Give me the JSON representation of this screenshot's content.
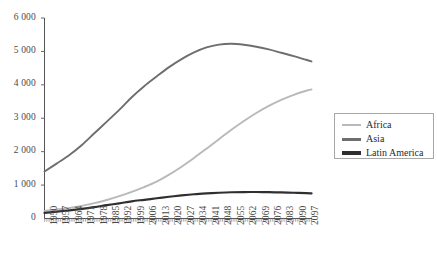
{
  "chart_data": {
    "type": "line",
    "title": "",
    "subtitle": "",
    "xlabel": "",
    "ylabel": "",
    "xlim": [
      1950,
      2100
    ],
    "ylim": [
      0,
      6000
    ],
    "grid": false,
    "legend_position": "right",
    "y_ticks": [
      {
        "value": 6000,
        "label": "6 000"
      },
      {
        "value": 5000,
        "label": "5 000"
      },
      {
        "value": 4000,
        "label": "4 000"
      },
      {
        "value": 3000,
        "label": "3 000"
      },
      {
        "value": 2000,
        "label": "2 000"
      },
      {
        "value": 1000,
        "label": "1 000"
      },
      {
        "value": 0,
        "label": "0"
      }
    ],
    "x_ticks": [
      "1950",
      "1957",
      "1964",
      "1971",
      "1978",
      "1985",
      "1992",
      "1999",
      "2006",
      "2013",
      "2020",
      "2027",
      "2034",
      "2041",
      "2048",
      "2055",
      "2062",
      "2069",
      "2076",
      "2083",
      "2090",
      "2097"
    ],
    "x": [
      1950,
      1957,
      1964,
      1971,
      1978,
      1985,
      1992,
      1999,
      2006,
      2013,
      2020,
      2027,
      2034,
      2041,
      2048,
      2055,
      2062,
      2069,
      2076,
      2083,
      2090,
      2097,
      2100
    ],
    "series": [
      {
        "name": "Africa",
        "color": "#b9b9b9",
        "values": [
          228,
          268,
          315,
          377,
          458,
          553,
          669,
          800,
          941,
          1104,
          1312,
          1551,
          1812,
          2090,
          2375,
          2655,
          2918,
          3158,
          3370,
          3552,
          3702,
          3822,
          3860
        ]
      },
      {
        "name": "Asia",
        "color": "#6e6e6e",
        "values": [
          1405,
          1650,
          1900,
          2200,
          2550,
          2900,
          3250,
          3630,
          3960,
          4250,
          4530,
          4770,
          4970,
          5120,
          5205,
          5230,
          5200,
          5140,
          5060,
          4960,
          4860,
          4750,
          4700
        ]
      },
      {
        "name": "Latin America",
        "color": "#2f2f2f",
        "values": [
          169,
          205,
          245,
          290,
          340,
          400,
          455,
          515,
          560,
          605,
          650,
          690,
          725,
          750,
          770,
          785,
          792,
          793,
          788,
          780,
          770,
          757,
          750
        ]
      }
    ]
  },
  "legend": {
    "entries": [
      {
        "label": "Africa"
      },
      {
        "label": "Asia"
      },
      {
        "label": "Latin America"
      }
    ]
  }
}
